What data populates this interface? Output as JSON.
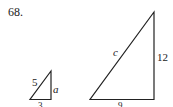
{
  "problem": {
    "number": "68."
  },
  "small_triangle": {
    "hypotenuse_label": "5",
    "vertical_label": "a",
    "base_label": "3"
  },
  "large_triangle": {
    "hypotenuse_label": "c",
    "vertical_label": "12",
    "base_label": "9"
  },
  "colors": {
    "line": "#222222",
    "background": "#ffffff"
  }
}
